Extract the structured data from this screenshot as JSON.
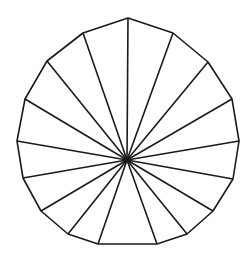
{
  "figure": {
    "type": "polygon-fan",
    "width": 250,
    "height": 257,
    "background": "#ffffff",
    "stroke_color": "#1a1a1a",
    "stroke_width": 1.6,
    "center": [
      127,
      160
    ],
    "vertices": [
      [
        128,
        18
      ],
      [
        173,
        33
      ],
      [
        208,
        62
      ],
      [
        232,
        99
      ],
      [
        239,
        141
      ],
      [
        233,
        179
      ],
      [
        213,
        211
      ],
      [
        187,
        234
      ],
      [
        157,
        244
      ],
      [
        98,
        244
      ],
      [
        68,
        234
      ],
      [
        41,
        211
      ],
      [
        23,
        178
      ],
      [
        17,
        141
      ],
      [
        25,
        99
      ],
      [
        47,
        61
      ],
      [
        83,
        33
      ]
    ],
    "vertex_count": 17,
    "spoke_count": 17
  }
}
